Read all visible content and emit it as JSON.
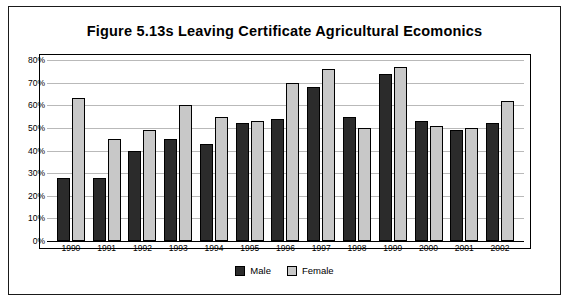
{
  "figure": {
    "title": "Figure 5.13s  Leaving Certificate Agricultural Ecomonics"
  },
  "legend": {
    "male_label": "Male",
    "female_label": "Female"
  },
  "colors": {
    "male": "#2b2b2b",
    "female": "#c8c8c8",
    "grid": "#b9b9b9",
    "border": "#000000",
    "background": "#ffffff"
  },
  "chart_data": {
    "type": "bar",
    "title": "Figure 5.13s  Leaving Certificate Agricultural Ecomonics",
    "xlabel": "",
    "ylabel": "",
    "categories": [
      "1990",
      "1991",
      "1992",
      "1993",
      "1994",
      "1995",
      "1996",
      "1997",
      "1998",
      "1999",
      "2000",
      "2001",
      "2002"
    ],
    "series": [
      {
        "name": "Male",
        "values": [
          28,
          28,
          40,
          45,
          43,
          52,
          54,
          68,
          55,
          74,
          53,
          49,
          52
        ]
      },
      {
        "name": "Female",
        "values": [
          63,
          45,
          49,
          60,
          55,
          53,
          70,
          76,
          50,
          77,
          51,
          50,
          62
        ]
      }
    ],
    "ylim": [
      0,
      80
    ],
    "yticks": [
      0,
      10,
      20,
      30,
      40,
      50,
      60,
      70,
      80
    ],
    "ytick_labels": [
      "0%",
      "10%",
      "20%",
      "30%",
      "40%",
      "50%",
      "60%",
      "70%",
      "80%"
    ],
    "grid": true,
    "legend_position": "bottom"
  }
}
